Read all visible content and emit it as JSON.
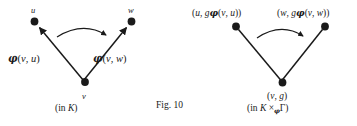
{
  "figure": {
    "number_label": "Fig. 10",
    "background_color": "#ffffff",
    "ink_color": "#1a1a1a"
  },
  "left_diagram": {
    "caption": "(in K)",
    "caption_prefix": "(in ",
    "caption_symbol": "K",
    "caption_suffix": ")",
    "nodes": {
      "top_left": "u",
      "top_right": "w",
      "bottom": "v"
    },
    "edge_labels": {
      "left_prefix": "(",
      "left_arg1": "v",
      "left_sep": ", ",
      "left_arg2": "u",
      "left_suffix": ")",
      "right_prefix": "(",
      "right_arg1": "v",
      "right_sep": ", ",
      "right_arg2": "w",
      "right_suffix": ")",
      "phi": "φ"
    }
  },
  "right_diagram": {
    "caption_prefix": "(in ",
    "caption_k": "K",
    "caption_times": " ×",
    "caption_sub": "φ",
    "caption_gamma": "Γ",
    "caption_suffix": ")",
    "nodes": {
      "top_left": {
        "open": "(",
        "first": "u",
        "sep": ", ",
        "g": "g",
        "phi": "φ",
        "inner_open": "(",
        "inner_a": "v",
        "inner_sep": ", ",
        "inner_b": "u",
        "inner_close": ")",
        "close": ")"
      },
      "top_right": {
        "open": "(",
        "first": "w",
        "sep": ", ",
        "g": "g",
        "phi": "φ",
        "inner_open": "(",
        "inner_a": "v",
        "inner_sep": ", ",
        "inner_b": "w",
        "inner_close": ")",
        "close": ")"
      },
      "bottom": {
        "open": "(",
        "first": "v",
        "sep": ", ",
        "second": "g",
        "close": ")"
      }
    }
  }
}
